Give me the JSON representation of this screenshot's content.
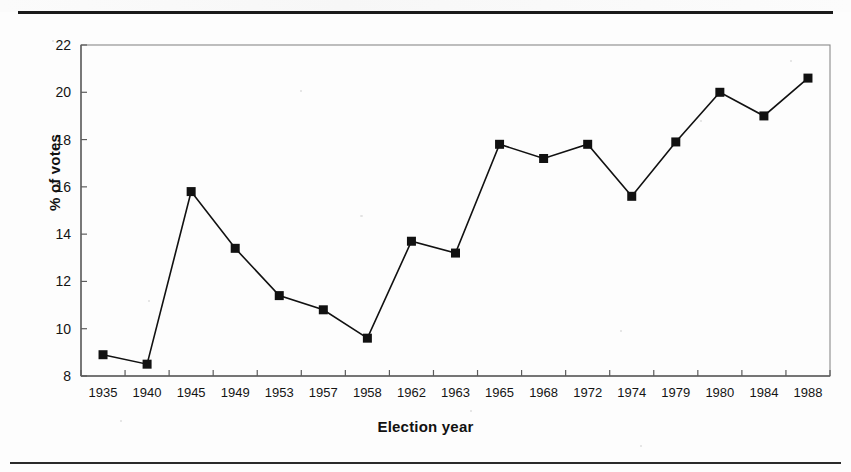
{
  "page": {
    "background_color": "#fdfdfd",
    "ink_color": "#111111",
    "rule_color": "#1a1a1a"
  },
  "chart_data": {
    "type": "line",
    "title": "",
    "subtitle": "",
    "xlabel": "Election year",
    "ylabel": "% of votes",
    "categories": [
      "1935",
      "1940",
      "1945",
      "1949",
      "1953",
      "1957",
      "1958",
      "1962",
      "1963",
      "1965",
      "1968",
      "1972",
      "1974",
      "1979",
      "1980",
      "1984",
      "1988"
    ],
    "values": [
      8.9,
      8.5,
      15.8,
      13.4,
      11.4,
      10.8,
      9.6,
      13.7,
      13.2,
      17.8,
      17.2,
      17.8,
      15.6,
      17.9,
      20.0,
      19.0,
      20.6
    ],
    "series": [
      {
        "name": "% of votes",
        "values": [
          8.9,
          8.5,
          15.8,
          13.4,
          11.4,
          10.8,
          9.6,
          13.7,
          13.2,
          17.8,
          17.2,
          17.8,
          15.6,
          17.9,
          20.0,
          19.0,
          20.6
        ]
      }
    ],
    "ylim": [
      8,
      22
    ],
    "ytick_labels": [
      "22",
      "20",
      "18",
      "16",
      "14",
      "12",
      "10",
      "8"
    ],
    "ytick_values": [
      22,
      20,
      18,
      16,
      14,
      12,
      10,
      8
    ],
    "grid": false,
    "legend": false,
    "legend_position": "none",
    "marker": "filled-square",
    "marker_color": "#111111",
    "line_color": "#111111",
    "line_width": 1.6,
    "plot_border": true,
    "plot_border_color": "#8a8a8a"
  },
  "axes": {
    "y_axis_label": "% of votes",
    "x_axis_label": "Election year"
  }
}
